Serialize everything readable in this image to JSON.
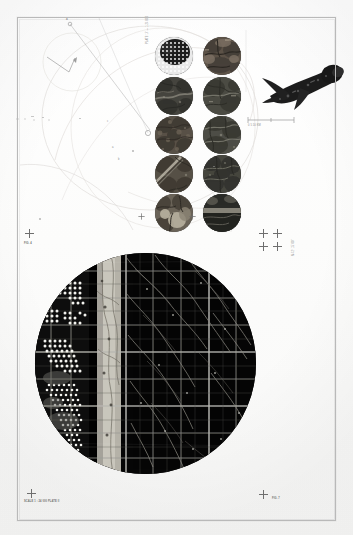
{
  "plate": {
    "title": "Photogrammetric plate — circular aerial mosaic",
    "background_color": "#ffffff",
    "frame_color": "#b9b9b9",
    "ink_color": "#111111"
  },
  "frame": {
    "label": "printed border rule"
  },
  "captions": {
    "top_vertical": "PLATE 17 — 1:24 000",
    "left_upper_mark": "A",
    "left_middle_caption": "FIG. 4",
    "left_lower_caption": "SCALE 1 : 24 000  PLATE II",
    "right_vertical": "N 42° 15' 00\"",
    "right_lower_caption": "FIG. 7",
    "centre_mark_a": "a",
    "centre_mark_b": "b",
    "centre_mark_c": "c",
    "scale_bar_label": "0          5          10 KM"
  },
  "tiles": {
    "label": "circular photo specimens",
    "rows": 5,
    "columns": 2,
    "items": [
      {
        "id": "tile-1",
        "caption": "1",
        "kind": "halftone-dot-grid",
        "tone": "#2b2b2b"
      },
      {
        "id": "tile-2",
        "caption": "2",
        "kind": "vegetation-mottle",
        "tone": "#4a4033"
      },
      {
        "id": "tile-3",
        "caption": "3",
        "kind": "river-channel",
        "tone": "#3b3b36"
      },
      {
        "id": "tile-4",
        "caption": "4",
        "kind": "field-texture",
        "tone": "#40413a"
      },
      {
        "id": "tile-5",
        "caption": "5",
        "kind": "granular-soil",
        "tone": "#4b4741"
      },
      {
        "id": "tile-6",
        "caption": "6",
        "kind": "ridge-shadow",
        "tone": "#474742"
      },
      {
        "id": "tile-7",
        "caption": "7",
        "kind": "diagonal-scar",
        "tone": "#4e4a42"
      },
      {
        "id": "tile-8",
        "caption": "8",
        "kind": "dense-canopy",
        "tone": "#3f4038"
      },
      {
        "id": "tile-9",
        "caption": "9",
        "kind": "rock-outcrop",
        "tone": "#565049"
      },
      {
        "id": "tile-10",
        "caption": "10",
        "kind": "shoreline-band",
        "tone": "#333430"
      }
    ]
  },
  "big_circle": {
    "label": "large circular aerial mosaic",
    "centre_x": 145,
    "centre_y": 363,
    "radius": 110,
    "base_tone": "#0a0a0a",
    "grid_line_color": "#8f8f8f",
    "notes": "dark section-line grid with white dot clusters at left and a pale vertical river band"
  },
  "aircraft": {
    "label": "dark aircraft silhouette",
    "tone": "#1a1a1a"
  },
  "marks": {
    "crosses": [
      {
        "name": "cross-left-middle",
        "x": 28,
        "y": 232
      },
      {
        "name": "cross-left-bottom",
        "x": 30,
        "y": 491
      },
      {
        "name": "cross-right-a",
        "x": 262,
        "y": 232
      },
      {
        "name": "cross-right-b",
        "x": 276,
        "y": 232
      },
      {
        "name": "cross-right-c",
        "x": 262,
        "y": 245
      },
      {
        "name": "cross-right-d",
        "x": 276,
        "y": 245
      },
      {
        "name": "cross-right-bottom",
        "x": 262,
        "y": 492
      },
      {
        "name": "cross-centre-top",
        "x": 140,
        "y": 215
      },
      {
        "name": "cross-centre-mid",
        "x": 191,
        "y": 215
      }
    ]
  }
}
